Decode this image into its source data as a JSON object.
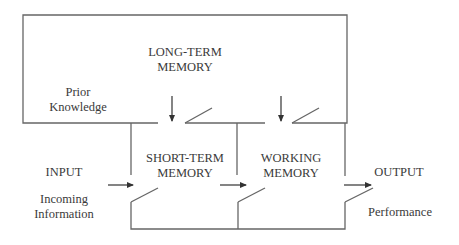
{
  "diagram": {
    "nodes": {
      "long_term_memory": {
        "line1": "LONG-TERM",
        "line2": "MEMORY"
      },
      "prior_knowledge": {
        "line1": "Prior",
        "line2": "Knowledge"
      },
      "input": {
        "label": "INPUT"
      },
      "incoming_information": {
        "line1": "Incoming",
        "line2": "Information"
      },
      "short_term_memory": {
        "line1": "SHORT-TERM",
        "line2": "MEMORY"
      },
      "working_memory": {
        "line1": "WORKING",
        "line2": "MEMORY"
      },
      "output": {
        "label": "OUTPUT"
      },
      "performance": {
        "label": "Performance"
      }
    },
    "edges": [
      {
        "from": "input",
        "to": "short_term_memory",
        "type": "arrow"
      },
      {
        "from": "short_term_memory",
        "to": "working_memory",
        "type": "arrow"
      },
      {
        "from": "working_memory",
        "to": "output",
        "type": "arrow"
      },
      {
        "from": "long_term_memory",
        "to": "short_term_memory",
        "type": "arrow"
      },
      {
        "from": "long_term_memory",
        "to": "working_memory",
        "type": "arrow"
      }
    ],
    "line_color": "#555555"
  }
}
